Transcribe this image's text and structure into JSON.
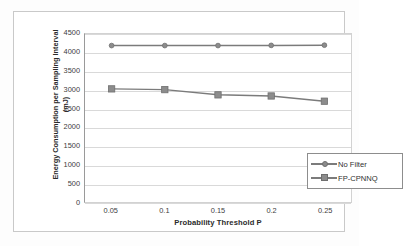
{
  "chart_data": {
    "type": "line",
    "title": "",
    "xlabel": "Probability Threshold P",
    "ylabel": "Energy Consumption per Sampling Interval (mJ)",
    "ylabel_line1": "Energy Consumption per Sampling Interval",
    "ylabel_line2": "(mJ)",
    "categories": [
      "0.05",
      "0.1",
      "0.15",
      "0.2",
      "0.25"
    ],
    "x": [
      0.05,
      0.1,
      0.15,
      0.2,
      0.25
    ],
    "ylim": [
      0,
      4500
    ],
    "ytick_labels": [
      "4500",
      "4000",
      "3500",
      "3000",
      "2500",
      "2000",
      "1500",
      "1000",
      "500",
      "0"
    ],
    "ytick_values": [
      4500,
      4000,
      3500,
      3000,
      2500,
      2000,
      1500,
      1000,
      500,
      0
    ],
    "grid": true,
    "legend_position": "center-right-inside",
    "series": [
      {
        "name": "No Filter",
        "marker": "diamond",
        "color": "#7b7b7b",
        "values": [
          4190,
          4190,
          4190,
          4195,
          4200
        ]
      },
      {
        "name": "FP-CPNNQ",
        "marker": "square",
        "color": "#7b7b7b",
        "values": [
          3030,
          3010,
          2870,
          2840,
          2700
        ]
      }
    ]
  },
  "legend": {
    "items": [
      {
        "label": "No Filter",
        "marker": "diamond"
      },
      {
        "label": "FP-CPNNQ",
        "marker": "square"
      }
    ]
  }
}
